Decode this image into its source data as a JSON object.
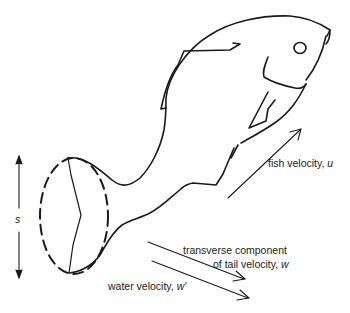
{
  "diagram": {
    "labels": {
      "span": "s",
      "fish_velocity_text": "fish velocity, ",
      "fish_velocity_symbol": "u",
      "transverse_line1": "transverse component",
      "transverse_line2_text": "of tail velocity, ",
      "transverse_symbol": "w",
      "water_velocity_text": "water velocity, ",
      "water_velocity_symbol": "w'"
    },
    "arrows": [
      {
        "name": "tail-span-arrow",
        "label": "s",
        "direction": "vertical double-headed"
      },
      {
        "name": "fish-velocity-arrow",
        "label": "fish velocity, u",
        "direction": "up-right"
      },
      {
        "name": "transverse-tail-velocity-arrow",
        "label": "transverse component of tail velocity, w",
        "direction": "down-right"
      },
      {
        "name": "water-velocity-arrow",
        "label": "water velocity, w'",
        "direction": "down-right"
      }
    ],
    "colors": {
      "ink": "#1a1a1a",
      "background": "#ffffff"
    }
  }
}
